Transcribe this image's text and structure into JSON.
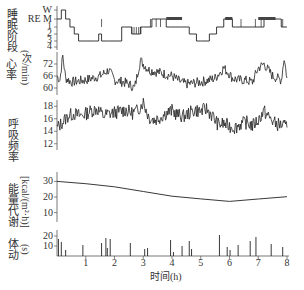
{
  "chart_data": [
    {
      "type": "line",
      "title": "",
      "ylabel": "睡眠阶段",
      "yticks": [
        "W",
        "REM",
        "1",
        "2",
        "3",
        "4"
      ],
      "xlabel": "时间(h)",
      "xlim": [
        0,
        8
      ],
      "x": [
        0,
        0.15,
        0.3,
        0.45,
        0.6,
        0.75,
        1.0,
        1.3,
        1.45,
        1.55,
        1.75,
        2.25,
        2.35,
        2.6,
        2.9,
        3.0,
        3.3,
        3.6,
        3.8,
        3.95,
        4.1,
        4.3,
        4.6,
        4.85,
        5.0,
        5.3,
        5.55,
        5.8,
        5.95,
        6.1,
        6.2,
        6.4,
        6.8,
        7.2,
        7.5,
        7.8,
        8.0
      ],
      "values": [
        "REM",
        "W",
        "REM",
        "1",
        "2",
        "3",
        "3",
        "3",
        "2",
        "3",
        "3",
        "1",
        "1",
        "2",
        "1",
        "1",
        "REM",
        "REM",
        "1",
        "1",
        "1",
        "1",
        "2",
        "3",
        "3",
        "2",
        "1",
        "REM",
        "REM",
        "1",
        "1",
        "1",
        "1",
        "REM",
        "REM",
        "1",
        "1"
      ]
    },
    {
      "type": "line",
      "ylabel": "心率(次/min)",
      "yticks": [
        60,
        66,
        72
      ],
      "ylim": [
        58,
        78
      ],
      "xlim": [
        0,
        8
      ],
      "x": [
        0,
        0.1,
        0.2,
        0.3,
        0.5,
        1.0,
        1.5,
        1.8,
        2.0,
        2.3,
        2.5,
        2.7,
        2.9,
        3.0,
        3.2,
        3.5,
        4.0,
        4.3,
        4.5,
        5.0,
        5.3,
        5.5,
        5.8,
        6.0,
        6.1,
        6.3,
        6.5,
        6.8,
        7.0,
        7.2,
        7.5,
        7.8,
        7.9,
        8.0
      ],
      "values": [
        66,
        64,
        76,
        65,
        63,
        64,
        66,
        69,
        64,
        63,
        62,
        60,
        74,
        72,
        69,
        68,
        66,
        63,
        62,
        63,
        64,
        65,
        70,
        67,
        65,
        64,
        64,
        63,
        70,
        72,
        66,
        64,
        75,
        65
      ]
    },
    {
      "type": "line",
      "ylabel": "呼吸频率",
      "yticks": [
        12,
        14,
        16,
        18
      ],
      "ylim": [
        11,
        19
      ],
      "xlim": [
        0,
        8
      ],
      "x": [
        0,
        0.2,
        0.4,
        0.6,
        0.8,
        1.0,
        1.2,
        1.4,
        1.6,
        1.8,
        2.0,
        2.2,
        2.4,
        2.6,
        2.8,
        3.0,
        3.2,
        3.4,
        3.6,
        3.8,
        4.0,
        4.2,
        4.4,
        4.6,
        4.8,
        5.0,
        5.2,
        5.4,
        5.6,
        5.8,
        6.0,
        6.2,
        6.4,
        6.6,
        6.8,
        7.0,
        7.2,
        7.4,
        7.6,
        7.8,
        8.0
      ],
      "values": [
        14.5,
        15.5,
        16.5,
        16.8,
        16.5,
        16.8,
        17.3,
        17.6,
        16.5,
        16.8,
        17.0,
        17.2,
        17.4,
        16.9,
        17.3,
        18.7,
        16.2,
        15.8,
        16.3,
        16.9,
        17.3,
        16.6,
        16.4,
        16.9,
        17.4,
        17.2,
        17.6,
        16.5,
        15.1,
        15.2,
        14.8,
        14.6,
        15.2,
        15.4,
        14.9,
        15.8,
        17.2,
        16.1,
        15.2,
        15.0,
        14.6
      ]
    },
    {
      "type": "line",
      "ylabel": "能量代谢 [kcal/(m²·h)]",
      "yticks": [
        10,
        20,
        30
      ],
      "ylim": [
        4,
        36
      ],
      "xlim": [
        0,
        8
      ],
      "x": [
        0,
        1,
        2,
        3,
        4,
        5,
        6,
        7,
        8
      ],
      "values": [
        30,
        28.5,
        26.5,
        23.5,
        20.5,
        18.8,
        17.2,
        18.7,
        20.2
      ]
    },
    {
      "type": "bar",
      "ylabel": "体动(s)",
      "yticks": [
        10,
        20
      ],
      "ylim": [
        0,
        24
      ],
      "xlabel": "时间(h)",
      "xticks": [
        1,
        2,
        3,
        4,
        5,
        6,
        7,
        8
      ],
      "xlim": [
        0,
        8
      ],
      "x": [
        0.05,
        0.15,
        0.3,
        0.9,
        1.55,
        1.7,
        1.75,
        1.85,
        2.55,
        3.05,
        3.15,
        3.95,
        4.05,
        4.35,
        4.6,
        4.68,
        5.65,
        5.92,
        6.02,
        6.3,
        6.72,
        6.92,
        7.45,
        7.85
      ],
      "values": [
        17,
        14,
        6,
        11,
        13,
        18,
        8,
        17,
        13,
        7,
        8,
        16,
        4,
        10,
        15,
        7,
        21,
        9,
        6,
        11,
        15,
        19,
        12,
        9
      ]
    }
  ],
  "labels": {
    "sleep_ylabel": "睡眠阶段",
    "hr_ylabel_1": "心率",
    "hr_ylabel_2": "(次/min)",
    "resp_ylabel": "呼吸频率",
    "energy_ylabel_1": "能量代谢",
    "energy_ylabel_2": "[kcal/(m²·h)]",
    "move_ylabel_1": "体动",
    "move_ylabel_2": "(s)",
    "xlabel": "时间(h)",
    "stage_W": "W",
    "stage_REM": "RE M"
  }
}
